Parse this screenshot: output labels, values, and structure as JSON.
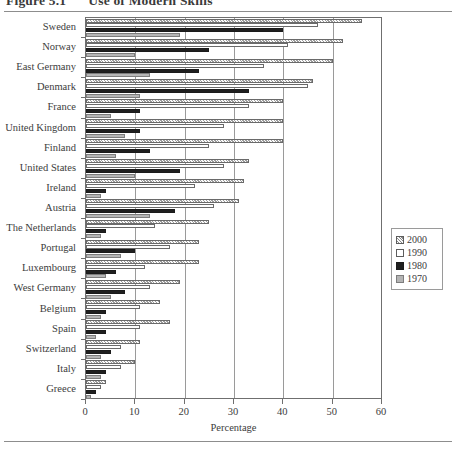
{
  "figure": {
    "number": "Figure 5.1",
    "title": "Use of Modern Skills",
    "axis_title": "Percentage"
  },
  "legend": {
    "items": [
      {
        "label": "2000",
        "key": "y2000",
        "color": "#d4d4d4"
      },
      {
        "label": "1990",
        "key": "y1990",
        "color": "#ffffff"
      },
      {
        "label": "1980",
        "key": "y1980",
        "color": "#1f1f1f"
      },
      {
        "label": "1970",
        "key": "y1970",
        "color": "#b6b6b6"
      }
    ]
  },
  "chart_data": {
    "type": "bar",
    "orientation": "horizontal",
    "title": "Use of Modern Skills",
    "xlabel": "Percentage",
    "ylabel": "",
    "xlim": [
      0,
      60
    ],
    "xticks": [
      0,
      10,
      20,
      30,
      40,
      50,
      60
    ],
    "grid": true,
    "legend_position": "right",
    "categories": [
      "Sweden",
      "Norway",
      "East Germany",
      "Denmark",
      "France",
      "United Kingdom",
      "Finland",
      "United States",
      "Ireland",
      "Austria",
      "The Netherlands",
      "Portugal",
      "Luxembourg",
      "West Germany",
      "Belgium",
      "Spain",
      "Switzerland",
      "Italy",
      "Greece"
    ],
    "series": [
      {
        "name": "2000",
        "values": [
          56,
          52,
          50,
          46,
          40,
          40,
          40,
          33,
          32,
          31,
          25,
          23,
          23,
          19,
          15,
          17,
          11,
          10,
          4
        ]
      },
      {
        "name": "1990",
        "values": [
          47,
          41,
          36,
          45,
          33,
          28,
          25,
          28,
          22,
          26,
          14,
          17,
          12,
          13,
          11,
          11,
          7,
          7,
          3
        ]
      },
      {
        "name": "1980",
        "values": [
          40,
          25,
          23,
          33,
          11,
          11,
          13,
          19,
          4,
          18,
          4,
          10,
          6,
          8,
          4,
          4,
          5,
          4,
          2
        ]
      },
      {
        "name": "1970",
        "values": [
          19,
          10,
          13,
          11,
          5,
          8,
          6,
          10,
          3,
          13,
          3,
          7,
          4,
          5,
          3,
          2,
          3,
          3,
          1
        ]
      }
    ]
  }
}
